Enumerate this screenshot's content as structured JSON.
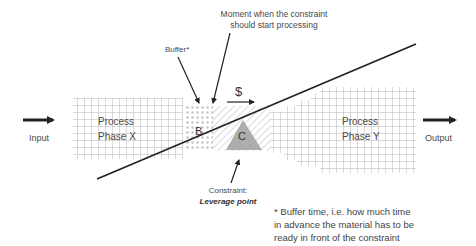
{
  "diagram": {
    "input_label": "Input",
    "output_label": "Output",
    "phase_x": {
      "line1": "Process",
      "line2": "Phase X"
    },
    "phase_y": {
      "line1": "Process",
      "line2": "Phase Y"
    },
    "buffer_letter": "B",
    "constraint_letter": "C",
    "money_symbol": "$",
    "buffer_annotation": "Buffer*",
    "moment_annotation": {
      "line1": "Moment when the constraint",
      "line2": "should start processing"
    },
    "constraint_annotation": {
      "line1": "Constraint:",
      "line2": "Leverage point"
    },
    "footnote": {
      "line1": "* Buffer time, i.e. how much time",
      "line2": "in advance the material has to be",
      "line3": "ready in front of the constraint"
    },
    "colors": {
      "grid": "#b8b8b8",
      "arrow": "#222222",
      "constraint_fill": "#9a9a9a",
      "text": "#4a4a4a"
    }
  }
}
